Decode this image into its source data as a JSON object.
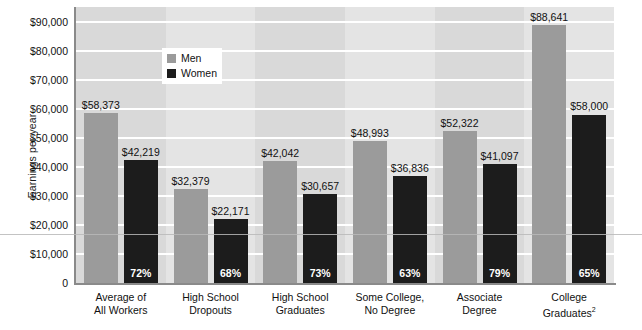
{
  "chart_data": {
    "type": "bar",
    "title": "",
    "xlabel": "",
    "ylabel": "Earnings per year",
    "ylim": [
      0,
      95000
    ],
    "grid": true,
    "legend_position": "top-left-inside",
    "categories": [
      "Average of\nAll Workers",
      "High School\nDropouts",
      "High School\nGraduates",
      "Some College,\nNo Degree",
      "Associate\nDegree",
      "College\nGraduates"
    ],
    "series": [
      {
        "name": "Men",
        "color": "#9b9b9b",
        "values": [
          58373,
          32379,
          42042,
          48993,
          52322,
          88641
        ],
        "labels": [
          "$58,373",
          "$32,379",
          "$42,042",
          "$48,993",
          "$52,322",
          "$88,641"
        ]
      },
      {
        "name": "Women",
        "color": "#1c1c1c",
        "values": [
          42219,
          22171,
          30657,
          36836,
          41097,
          58000
        ],
        "labels": [
          "$42,219",
          "$22,171",
          "$30,657",
          "$36,836",
          "$41,097",
          "$58,000"
        ],
        "ratio_labels": [
          "72%",
          "68%",
          "73%",
          "63%",
          "79%",
          "65%"
        ]
      }
    ],
    "y_ticks": [
      0,
      10000,
      20000,
      30000,
      40000,
      50000,
      60000,
      70000,
      80000,
      90000
    ],
    "y_tick_labels": [
      "0",
      "$10,000",
      "$20,000",
      "$30,000",
      "$40,000",
      "$50,000",
      "$60,000",
      "$70,000",
      "$80,000",
      "$90,000"
    ]
  },
  "axis": {
    "y_title": "Earnings per year"
  },
  "legend": {
    "items": [
      {
        "label": "Men",
        "color": "#9b9b9b"
      },
      {
        "label": "Women",
        "color": "#1c1c1c"
      }
    ]
  },
  "categories_display": [
    {
      "line1": "Average of",
      "line2": "All Workers",
      "sup": ""
    },
    {
      "line1": "High School",
      "line2": "Dropouts",
      "sup": ""
    },
    {
      "line1": "High School",
      "line2": "Graduates",
      "sup": ""
    },
    {
      "line1": "Some College,",
      "line2": "No Degree",
      "sup": ""
    },
    {
      "line1": "Associate",
      "line2": "Degree",
      "sup": ""
    },
    {
      "line1": "College",
      "line2": "Graduates",
      "sup": "2"
    }
  ]
}
